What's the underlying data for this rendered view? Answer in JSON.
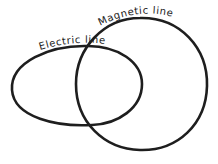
{
  "diagram": {
    "type": "intersecting-loops",
    "background": "#ffffff",
    "stroke_color": "#1e1e1e",
    "labels": {
      "electric_line": "Electric line",
      "magnetic_line": "Magnetic line"
    },
    "shapes": [
      {
        "name": "electric-line-loop",
        "label": "Electric line",
        "kind": "ellipse"
      },
      {
        "name": "magnetic-line-loop",
        "label": "Magnetic line",
        "kind": "circle"
      }
    ]
  }
}
